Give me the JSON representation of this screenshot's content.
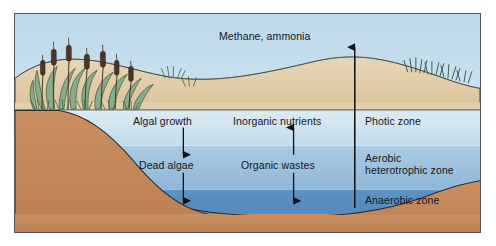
{
  "figure": {
    "frame_color": "#4a5560",
    "background_color": "#ffffff"
  },
  "labels": {
    "methane_ammonia": "Methane, ammonia",
    "algal_growth": "Algal growth",
    "dead_algae": "Dead algae",
    "inorganic_nutrients": "Inorganic nutrients",
    "organic_wastes": "Organic wastes",
    "photic_zone": "Photic zone",
    "aerobic_line1": "Aerobic",
    "aerobic_line2": "heterotrophic zone",
    "anaerobic_zone": "Anaerobic zone"
  },
  "zones": [
    {
      "name": "photic-zone",
      "label": "Photic zone",
      "top_px": 108,
      "bottom_px": 144,
      "color": "#cfe2ef"
    },
    {
      "name": "aerobic-heterotrophic-zone",
      "label": "Aerobic heterotrophic zone",
      "top_px": 144,
      "bottom_px": 188,
      "color": "#9cc0dd"
    },
    {
      "name": "anaerobic-zone",
      "label": "Anaerobic zone",
      "top_px": 188,
      "bottom_px": 222,
      "color": "#5f93c4"
    }
  ],
  "colors": {
    "sky": "#c3daea",
    "sand_light": "#e9d9b8",
    "sand_mid": "#dcc79f",
    "sediment": "#c4895c",
    "water_top": "#d5e5f0",
    "water_mid": "#9dc1de",
    "water_deep": "#4e86bb",
    "plant_green": "#7a9e7e",
    "plant_dark": "#3d6340",
    "cattail_brown": "#4a3526",
    "outline": "#2b2b2b",
    "arrow": "#111111",
    "text": "#12161c"
  },
  "arrows": [
    {
      "name": "methane-ammonia-arrow",
      "direction": "up",
      "x": 353,
      "from_y": 205,
      "to_y": 44
    },
    {
      "name": "algal-to-dead-algae-arrow",
      "direction": "down",
      "x": 182,
      "from_y": 128,
      "to_y": 152
    },
    {
      "name": "dead-algae-sink-arrow",
      "direction": "down",
      "x": 182,
      "from_y": 172,
      "to_y": 196
    },
    {
      "name": "inorganic-nutrients-arrow",
      "direction": "up",
      "x": 292,
      "from_y": 152,
      "to_y": 128
    },
    {
      "name": "organic-wastes-arrow",
      "direction": "down",
      "x": 292,
      "from_y": 172,
      "to_y": 196
    }
  ],
  "elements": [
    {
      "name": "cattail-reeds",
      "count": 7,
      "side": "left-bank"
    },
    {
      "name": "grass-tuft-right-hill",
      "side": "right-hill"
    },
    {
      "name": "grass-tuft-mid-bank",
      "side": "mid-bank"
    }
  ]
}
